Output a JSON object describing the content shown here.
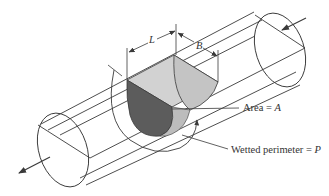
{
  "figure": {
    "colors": {
      "line": "#3a3a3a",
      "background": "#ffffff",
      "shade_light": "#cfcfcf",
      "shade_mid": "#bdbdbd",
      "shade_dark": "#5a5a5a",
      "text": "#333333"
    }
  },
  "labels": {
    "length": "L",
    "top_width": "B",
    "area_text": "Area = ",
    "area_symbol": "A",
    "perimeter_text": "Wetted perimeter = ",
    "perimeter_symbol": "P"
  },
  "arrows": {
    "inflow": "flow-in-arrow (upper right)",
    "outflow": "flow-out-arrow (lower left)"
  }
}
